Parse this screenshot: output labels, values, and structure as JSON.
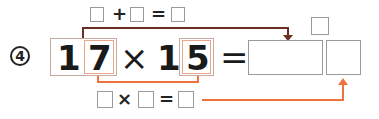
{
  "problem": {
    "number_label": "4",
    "multiplicand": {
      "tens": "1",
      "ones": "7"
    },
    "operator": "×",
    "multiplier": {
      "tens": "1",
      "ones": "5"
    },
    "equals": "=",
    "answer_boxes": [
      "",
      ""
    ],
    "carry_box": ""
  },
  "top_helper": {
    "box_a": "",
    "operator": "+",
    "box_b": "",
    "equals": "=",
    "result": ""
  },
  "bottom_helper": {
    "box_a": "",
    "operator": "×",
    "box_b": "",
    "equals": "=",
    "result": ""
  },
  "colors": {
    "top_connector": "#6b2e22",
    "bottom_connector": "#f0723c",
    "box_border": "#9a9a9a",
    "highlight_box": "#e8a58a"
  }
}
